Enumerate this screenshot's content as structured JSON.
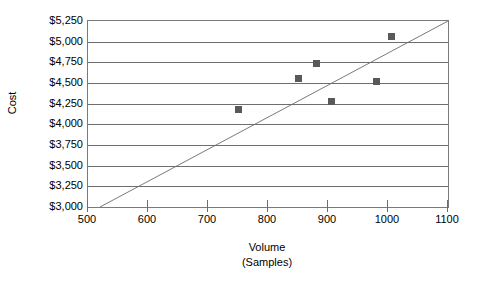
{
  "chart_data": {
    "type": "scatter",
    "title": "",
    "xlabel": "Volume",
    "xlabel_line2": "(Samples)",
    "ylabel": "Cost",
    "xlim": [
      500,
      1100
    ],
    "ylim": [
      3000,
      5250
    ],
    "grid": true,
    "legend": "none",
    "x_ticks": [
      500,
      600,
      700,
      800,
      900,
      1000,
      1100
    ],
    "x_tick_labels": [
      "500",
      "600",
      "700",
      "800",
      "900",
      "1000",
      "1100"
    ],
    "y_ticks": [
      3000,
      3250,
      3500,
      3750,
      4000,
      4250,
      4500,
      4750,
      5000,
      5250
    ],
    "y_tick_labels": [
      "$3,000",
      "$3,250",
      "$3,500",
      "$3,750",
      "$4,000",
      "$4,250",
      "$4,500",
      "$4,750",
      "$5,000",
      "$5,250"
    ],
    "series": [
      {
        "name": "Cost observations",
        "marker": "square",
        "color": "#595959",
        "points": [
          {
            "x": 750,
            "y": 4175
          },
          {
            "x": 850,
            "y": 4560
          },
          {
            "x": 880,
            "y": 4740
          },
          {
            "x": 905,
            "y": 4275
          },
          {
            "x": 980,
            "y": 4520
          },
          {
            "x": 1005,
            "y": 5060
          }
        ]
      }
    ],
    "reference_line": {
      "name": "diagonal reference line",
      "color": "#7a7a7a",
      "from": {
        "x": 520,
        "y": 3000
      },
      "to": {
        "x": 1100,
        "y": 5250
      }
    }
  },
  "colors": {
    "marker": "#595959",
    "gridline": "#6e6e6e",
    "frame": "#7a7a7a",
    "reference_line": "#7a7a7a",
    "background": "#ffffff",
    "text": "#000000"
  }
}
